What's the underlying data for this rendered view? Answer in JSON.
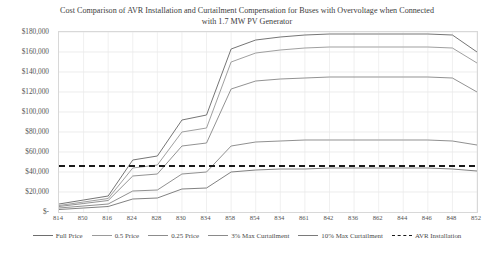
{
  "chart_data": {
    "type": "line",
    "title": "Cost Comparison of AVR Installation and Curtailment Compensation for Buses with Overvoltage when Connected with 1.7 MW PV Generator",
    "xlabel": "",
    "ylabel": "",
    "grid": true,
    "legend_position": "bottom",
    "ylim": [
      0,
      180000
    ],
    "ytick_labels": [
      "$180,000",
      "$160,000",
      "$140,000",
      "$120,000",
      "$100,000",
      "$80,000",
      "$60,000",
      "$40,000",
      "$20,000",
      "$-"
    ],
    "ytick_values": [
      180000,
      160000,
      140000,
      120000,
      100000,
      80000,
      60000,
      40000,
      20000,
      0
    ],
    "categories": [
      "814",
      "850",
      "816",
      "824",
      "828",
      "830",
      "834",
      "858",
      "854",
      "834",
      "861",
      "842",
      "836",
      "862",
      "844",
      "846",
      "848",
      "852"
    ],
    "series": [
      {
        "name": "Full Price",
        "color": "#6e6e6e",
        "style": "solid",
        "values": [
          8000,
          12000,
          16000,
          52000,
          56000,
          92000,
          97000,
          163000,
          172000,
          175000,
          177000,
          178000,
          178000,
          178000,
          178000,
          178000,
          177000,
          160000
        ]
      },
      {
        "name": "0.5 Price",
        "color": "#9a9a9a",
        "style": "solid",
        "values": [
          6500,
          10000,
          13500,
          44000,
          47000,
          80000,
          84000,
          150000,
          159000,
          162000,
          164000,
          165000,
          165000,
          165000,
          165000,
          165000,
          164000,
          149000
        ]
      },
      {
        "name": "0.25 Price",
        "color": "#8c8c8c",
        "style": "solid",
        "values": [
          5500,
          8500,
          11500,
          36000,
          38000,
          66000,
          69000,
          123000,
          131000,
          133000,
          134000,
          135000,
          135000,
          135000,
          135000,
          135000,
          134000,
          120000
        ]
      },
      {
        "name": "3% Max Curtailment",
        "color": "#8a8a8a",
        "style": "solid",
        "values": [
          4000,
          6000,
          8000,
          21000,
          22000,
          38000,
          40000,
          66000,
          70000,
          71000,
          72000,
          72000,
          72000,
          72000,
          72000,
          72000,
          71000,
          67000
        ]
      },
      {
        "name": "10% Max Curtailment",
        "color": "#7a7a7a",
        "style": "solid",
        "values": [
          2500,
          4000,
          5500,
          13000,
          14000,
          23000,
          24000,
          40000,
          42000,
          43000,
          43000,
          44000,
          44000,
          44000,
          44000,
          44000,
          43000,
          41000
        ]
      },
      {
        "name": "AVR Installation",
        "color": "#1a1a1a",
        "style": "dashed",
        "values": [
          46000,
          46000,
          46000,
          46000,
          46000,
          46000,
          46000,
          46000,
          46000,
          46000,
          46000,
          46000,
          46000,
          46000,
          46000,
          46000,
          46000,
          46000
        ]
      }
    ]
  }
}
